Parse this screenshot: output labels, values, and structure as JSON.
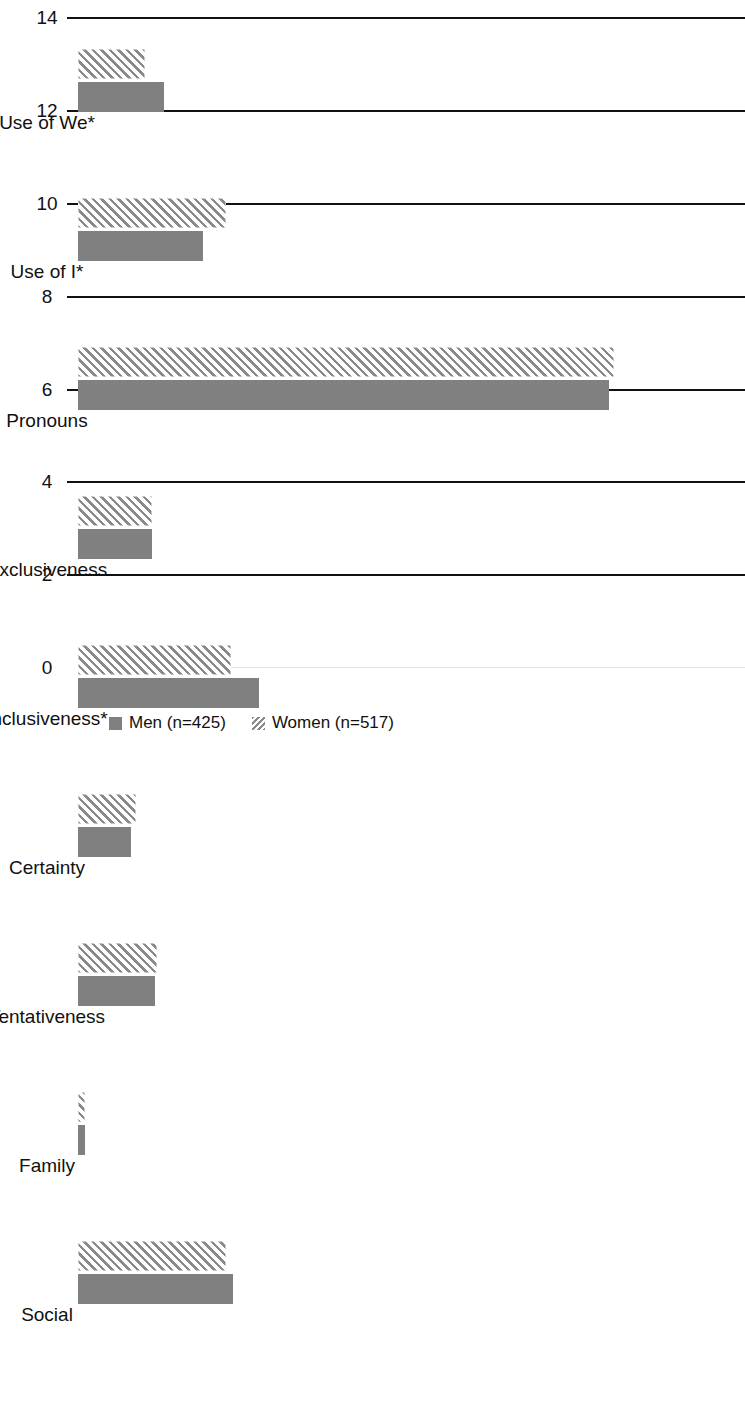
{
  "chart_data": {
    "type": "bar",
    "orientation": "horizontal",
    "title": "",
    "subtitle": "",
    "xlabel": "",
    "ylabel": "",
    "grid": true,
    "legend_position": "bottom",
    "axis": {
      "min": 0,
      "max": 14,
      "tick_step": 2,
      "tick_labels": [
        "14",
        "12",
        "10",
        "8",
        "6",
        "4",
        "2",
        "0"
      ],
      "tick_values": [
        14,
        12,
        10,
        8,
        6,
        4,
        2,
        0
      ]
    },
    "categories": [
      "Social",
      "Family",
      "Tentativeness",
      "Certainty",
      "Inclusiveness*",
      "Exclusiveness",
      "Pronouns",
      "Use of I*",
      "Use of We*"
    ],
    "series": [
      {
        "name": "Men (n=425)",
        "pattern": "solid",
        "color": "#808080",
        "values": [
          3.35,
          0.15,
          1.65,
          1.15,
          3.9,
          1.6,
          11.45,
          2.7,
          1.85
        ]
      },
      {
        "name": "Women (n=517)",
        "pattern": "diagonal-hatch",
        "color": "#8a8a8a",
        "values": [
          3.2,
          0.15,
          1.7,
          1.25,
          3.3,
          1.6,
          11.55,
          3.2,
          1.45
        ]
      }
    ],
    "annotations": {
      "significance_marker": "*"
    }
  },
  "legend": {
    "items": [
      {
        "label": "Men (n=425)",
        "swatch": "men-swatch"
      },
      {
        "label": "Women (n=517)",
        "swatch": "women-swatch"
      }
    ]
  }
}
